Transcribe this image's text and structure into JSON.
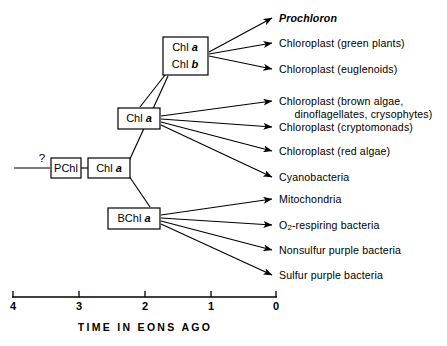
{
  "figure": {
    "background_color": "#ffffff",
    "line_color": "#000000"
  },
  "root": {
    "uncertainty_marker": "?"
  },
  "nodes": [
    {
      "id": "pchl",
      "label": "PChl",
      "italic_part": ""
    },
    {
      "id": "chla_root",
      "label": "Chl ",
      "italic_part": "a"
    },
    {
      "id": "chlab",
      "line1_label": "Chl ",
      "line1_italic": "a",
      "line2_label": "Chl ",
      "line2_italic": "b"
    },
    {
      "id": "chla_mid",
      "label": "Chl ",
      "italic_part": "a"
    },
    {
      "id": "bchla",
      "label": "BChl ",
      "italic_part": "a"
    }
  ],
  "tips": {
    "group_chlab": [
      {
        "text": "Prochloron",
        "style": "italic"
      },
      {
        "text": "Chloroplast (green plants)",
        "style": "normal"
      },
      {
        "text": "Chloroplast (euglenoids)",
        "style": "normal"
      }
    ],
    "group_chla_mid": [
      {
        "text": "Chloroplast (brown algae,",
        "text_line2": "     dinoflagellates, crysophytes)",
        "style": "normal"
      },
      {
        "text": "Chloroplast (cryptomonads)",
        "style": "normal"
      },
      {
        "text": "Chloroplast (red algae)",
        "style": "normal"
      },
      {
        "text": "Cyanobacteria",
        "style": "normal"
      }
    ],
    "group_bchla": [
      {
        "text": "Mitochondria",
        "style": "normal"
      },
      {
        "text": "O",
        "subscript": "2",
        "text_after": "-respiring bacteria",
        "style": "normal"
      },
      {
        "text": "Nonsulfur purple bacteria",
        "style": "normal"
      },
      {
        "text": "Sulfur purple bacteria",
        "style": "normal"
      }
    ]
  },
  "axis": {
    "caption": "TIME IN EONS AGO",
    "ticks": [
      "4",
      "3",
      "2",
      "1",
      "0"
    ],
    "min": 0,
    "max": 4,
    "direction": "decreasing-left-to-right"
  }
}
